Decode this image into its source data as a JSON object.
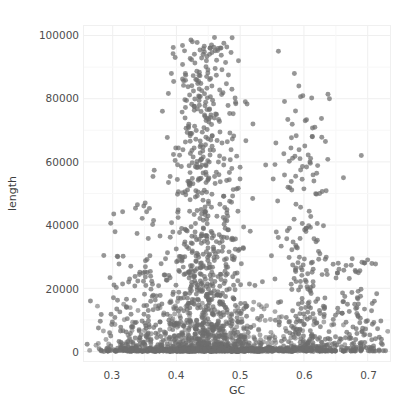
{
  "chart_data": {
    "type": "scatter",
    "title": "",
    "xlabel": "GC",
    "ylabel": "length",
    "xlim": [
      0.255,
      0.735
    ],
    "ylim": [
      -3000,
      103000
    ],
    "grid": true,
    "legend": null,
    "x_ticks": [
      0.3,
      0.4,
      0.5,
      0.6,
      0.7
    ],
    "x_tick_labels": [
      "0.3",
      "0.4",
      "0.5",
      "0.6",
      "0.7"
    ],
    "y_ticks": [
      0,
      20000,
      40000,
      60000,
      80000,
      100000
    ],
    "y_tick_labels": [
      "0",
      "20000",
      "40000",
      "60000",
      "80000",
      "100000"
    ],
    "marker": {
      "shape": "circle",
      "color": "#6e6e6e",
      "size_px": 5.0,
      "opacity": 0.72,
      "edge": "none"
    },
    "panel_background": "#ffffff",
    "grid_color": "#efefef",
    "n_points": 1860,
    "clusters": [
      {
        "name": "main-plume",
        "gc_center": 0.445,
        "gc_spread": 0.038,
        "length_median": 22000,
        "length_max": 100000,
        "n": 900
      },
      {
        "name": "secondary-cluster",
        "gc_center": 0.6,
        "gc_spread": 0.022,
        "length_median": 15000,
        "length_max": 82000,
        "n": 260
      },
      {
        "name": "left-tail",
        "gc_center": 0.33,
        "gc_spread": 0.03,
        "length_median": 6000,
        "length_max": 47000,
        "n": 190
      },
      {
        "name": "right-tail",
        "gc_center": 0.68,
        "gc_spread": 0.025,
        "length_median": 5000,
        "length_max": 30000,
        "n": 160
      },
      {
        "name": "zero-length-band",
        "gc_center": 0.47,
        "gc_spread": 0.09,
        "length_median": 300,
        "length_max": 1200,
        "n": 350
      }
    ]
  }
}
